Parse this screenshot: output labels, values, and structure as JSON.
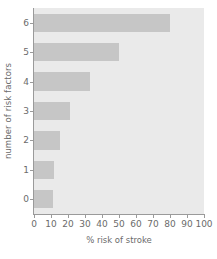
{
  "chart_data": {
    "type": "bar",
    "orientation": "horizontal",
    "title": "",
    "xlabel": "% risk of stroke",
    "ylabel": "number of risk factors",
    "categories": [
      "0",
      "1",
      "2",
      "3",
      "4",
      "5",
      "6"
    ],
    "values": [
      11,
      12,
      15,
      21,
      33,
      50,
      80
    ],
    "xlim": [
      0,
      100
    ],
    "xticks": [
      "0",
      "10",
      "20",
      "30",
      "40",
      "50",
      "60",
      "70",
      "80",
      "90",
      "100"
    ],
    "xtick_values": [
      0,
      10,
      20,
      30,
      40,
      50,
      60,
      70,
      80,
      90,
      100
    ],
    "yticks": [
      "0",
      "1",
      "2",
      "3",
      "4",
      "5",
      "6"
    ],
    "grid": false,
    "legend": null,
    "colors": {
      "bar": "#c6c6c6",
      "plot_background": "#eaeaea",
      "figure_background": "#ffffff",
      "axis": "#9a9a9a",
      "text": "#6b6b6b"
    }
  }
}
